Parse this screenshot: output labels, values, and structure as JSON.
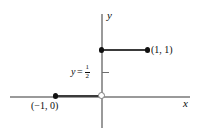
{
  "chart_data": {
    "type": "line",
    "title": "",
    "xlabel": "x",
    "ylabel": "y",
    "xlim": [
      -2,
      2
    ],
    "ylim": [
      -0.9,
      1.8
    ],
    "grid": false,
    "legend": null,
    "series": [
      {
        "name": "segment-on-x-axis",
        "kind": "closed-segment",
        "x": [
          -1,
          0
        ],
        "y": [
          0,
          0
        ],
        "endpoints": [
          {
            "point": [
              -1,
              0
            ],
            "marker": "filled"
          },
          {
            "point": [
              0,
              0
            ],
            "marker": "open"
          }
        ]
      },
      {
        "name": "segment-at-y-equals-one",
        "kind": "closed-segment",
        "x": [
          0,
          1
        ],
        "y": [
          1,
          1
        ],
        "endpoints": [
          {
            "point": [
              0,
              1
            ],
            "marker": "filled"
          },
          {
            "point": [
              1,
              1
            ],
            "marker": "filled"
          }
        ]
      }
    ],
    "annotations": [
      {
        "name": "point-one-one-label",
        "text": "(1, 1)",
        "at": [
          1,
          1
        ]
      },
      {
        "name": "point-minus-one-zero-label",
        "text": "(−1, 0)",
        "at": [
          -1,
          0
        ]
      },
      {
        "name": "y-equals-one-half-label",
        "text": "y = 1/2",
        "at": [
          0,
          0.5
        ]
      }
    ],
    "axis_ticks": [
      {
        "axis": "y",
        "value": 0.5,
        "label": "1/2",
        "tick": true
      }
    ]
  },
  "axes": {
    "y_label": "y",
    "x_label": "x"
  },
  "labels": {
    "point_one_one": "(1, 1)",
    "point_minus_one_zero": "(−1, 0)",
    "half_variable": "y",
    "half_equals": "=",
    "half_numerator": "1",
    "half_denominator": "2"
  },
  "colors": {
    "background": "#ffffff",
    "axis": "#9a9a9a",
    "segment": "#3a3a3a",
    "filled_marker": "#111111",
    "open_marker_stroke": "#7c7c7c",
    "text": "#0c0c0c"
  }
}
